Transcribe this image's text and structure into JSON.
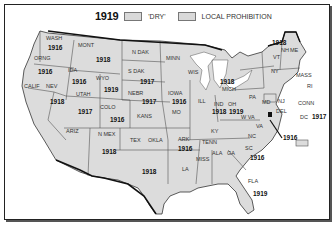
{
  "legend": {
    "year": "1919",
    "dry_label": "'DRY'",
    "local_label": "LOCAL PROHIBITION",
    "dry_color": "#d9d9d9",
    "local_color": "#d9d9d9"
  },
  "states": [
    {
      "abbr": "WASH",
      "year": "1916"
    },
    {
      "abbr": "ORNG",
      "year": "1916"
    },
    {
      "abbr": "CALIF",
      "year": ""
    },
    {
      "abbr": "IDA",
      "year": "1916"
    },
    {
      "abbr": "NEV",
      "year": "1918"
    },
    {
      "abbr": "MONT",
      "year": "1918"
    },
    {
      "abbr": "WYO",
      "year": "1919"
    },
    {
      "abbr": "UTAH",
      "year": "1917"
    },
    {
      "abbr": "COLO",
      "year": "1916"
    },
    {
      "abbr": "ARIZ",
      "year": ""
    },
    {
      "abbr": "N MEX",
      "year": "1918"
    },
    {
      "abbr": "N DAK",
      "year": ""
    },
    {
      "abbr": "S DAK",
      "year": "1917"
    },
    {
      "abbr": "NEBR",
      "year": "1917"
    },
    {
      "abbr": "KANS",
      "year": ""
    },
    {
      "abbr": "OKLA",
      "year": ""
    },
    {
      "abbr": "TEX",
      "year": "1918"
    },
    {
      "abbr": "MINN",
      "year": ""
    },
    {
      "abbr": "IOWA",
      "year": "1916"
    },
    {
      "abbr": "MO",
      "year": ""
    },
    {
      "abbr": "ARK",
      "year": "1916"
    },
    {
      "abbr": "LA",
      "year": ""
    },
    {
      "abbr": "WIS",
      "year": ""
    },
    {
      "abbr": "ILL",
      "year": ""
    },
    {
      "abbr": "MICH",
      "year": "1918"
    },
    {
      "abbr": "IND",
      "year": "1918"
    },
    {
      "abbr": "OH",
      "year": "1919"
    },
    {
      "abbr": "KY",
      "year": ""
    },
    {
      "abbr": "TENN",
      "year": ""
    },
    {
      "abbr": "MISS",
      "year": ""
    },
    {
      "abbr": "ALA",
      "year": ""
    },
    {
      "abbr": "GA",
      "year": ""
    },
    {
      "abbr": "FLA",
      "year": "1919"
    },
    {
      "abbr": "SC",
      "year": "1916"
    },
    {
      "abbr": "NC",
      "year": ""
    },
    {
      "abbr": "VA",
      "year": "1916"
    },
    {
      "abbr": "W VA",
      "year": ""
    },
    {
      "abbr": "PA",
      "year": ""
    },
    {
      "abbr": "NY",
      "year": ""
    },
    {
      "abbr": "MD",
      "year": ""
    },
    {
      "abbr": "DEL",
      "year": ""
    },
    {
      "abbr": "NJ",
      "year": ""
    },
    {
      "abbr": "VT",
      "year": ""
    },
    {
      "abbr": "NH",
      "year": "1918"
    },
    {
      "abbr": "ME",
      "year": ""
    },
    {
      "abbr": "MASS",
      "year": ""
    },
    {
      "abbr": "RI",
      "year": ""
    },
    {
      "abbr": "CONN",
      "year": ""
    },
    {
      "abbr": "DC",
      "year": "1917"
    }
  ]
}
